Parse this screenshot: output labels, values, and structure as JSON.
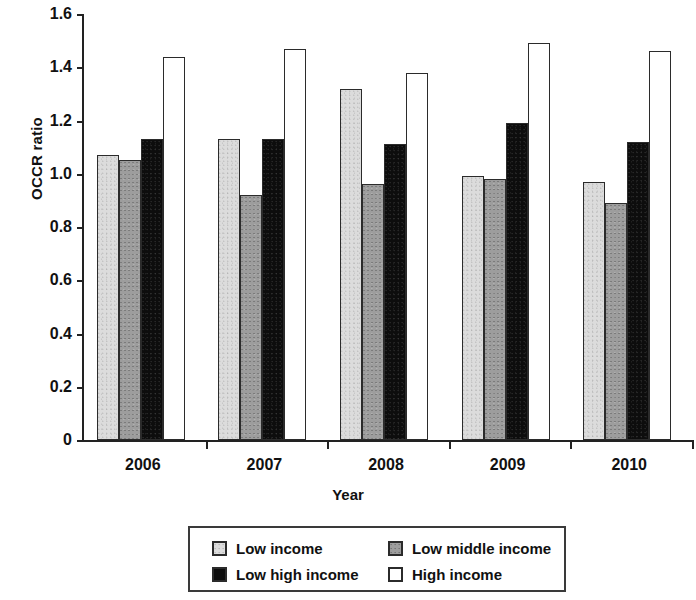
{
  "chart_data": {
    "type": "bar",
    "title": "",
    "xlabel": "Year",
    "ylabel": "OCCR ratio",
    "categories": [
      "2006",
      "2007",
      "2008",
      "2009",
      "2010"
    ],
    "ylim": [
      0,
      1.6
    ],
    "ytick_labels": [
      "1.6",
      "1.4",
      "1.2",
      "1.0",
      "0.8",
      "0.6",
      "0.4",
      "0.2",
      "0"
    ],
    "ytick_values": [
      1.6,
      1.4,
      1.2,
      1.0,
      0.8,
      0.6,
      0.4,
      0.2,
      0
    ],
    "grid": false,
    "legend_position": "bottom-center",
    "series": [
      {
        "name": "Low income",
        "color": "#dcdcdc",
        "values": [
          1.07,
          1.13,
          1.32,
          0.99,
          0.97
        ]
      },
      {
        "name": "Low middle income",
        "color": "#9d9d9d",
        "values": [
          1.05,
          0.92,
          0.96,
          0.98,
          0.89
        ]
      },
      {
        "name": "Low high income",
        "color": "#0d0d0d",
        "values": [
          1.13,
          1.13,
          1.11,
          1.19,
          1.12
        ]
      },
      {
        "name": "High income",
        "color": "#ffffff",
        "values": [
          1.44,
          1.47,
          1.38,
          1.49,
          1.46
        ]
      }
    ]
  },
  "axes": {
    "y_title": "OCCR ratio",
    "x_title": "Year"
  },
  "legend": {
    "entries": [
      {
        "label": "Low income",
        "swatch": "light-gray-square"
      },
      {
        "label": "Low middle income",
        "swatch": "medium-gray-square"
      },
      {
        "label": "Low high income",
        "swatch": "black-square"
      },
      {
        "label": "High income",
        "swatch": "white-square"
      }
    ]
  }
}
